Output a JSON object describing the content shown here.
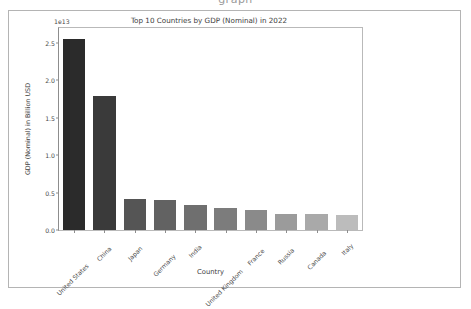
{
  "figure": {
    "cropped_top_text": "graph",
    "background_color": "#ffffff",
    "frame_color": "#b4b4b4"
  },
  "chart_data": {
    "type": "bar",
    "title": "Top 10 Countries by GDP (Nominal) in 2022",
    "xlabel": "Country",
    "ylabel": "GDP (Nominal) in Billion USD",
    "y_offset_text": "1e13",
    "y_offset_value": 10000000000000.0,
    "categories": [
      "United States",
      "China",
      "Japan",
      "Germany",
      "India",
      "United Kingdom",
      "France",
      "Russia",
      "Canada",
      "Italy"
    ],
    "values": [
      2.55,
      1.79,
      0.42,
      0.4,
      0.33,
      0.3,
      0.27,
      0.22,
      0.21,
      0.2
    ],
    "values_absolute": [
      25500000000000,
      17900000000000,
      4200000000000,
      4000000000000,
      3300000000000,
      3000000000000,
      2700000000000,
      2200000000000,
      2100000000000,
      2000000000000
    ],
    "bar_colors": [
      "#2b2b2b",
      "#3a3a3a",
      "#555555",
      "#626262",
      "#6f6f6f",
      "#7c7c7c",
      "#8a8a8a",
      "#9b9b9b",
      "#a9a9a9",
      "#bcbcbc"
    ],
    "ylim": [
      0.0,
      2.7
    ],
    "yticks": [
      0.0,
      0.5,
      1.0,
      1.5,
      2.0,
      2.5
    ],
    "ytick_labels": [
      "0.0",
      "0.5",
      "1.0",
      "1.5",
      "2.0",
      "2.5"
    ],
    "grid": false,
    "legend": null,
    "xtick_rotation": -45
  }
}
